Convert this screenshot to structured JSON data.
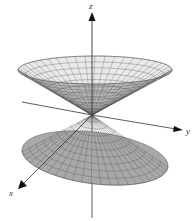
{
  "figure": {
    "type": "double-cone-surface",
    "axes": {
      "x_label": "x",
      "y_label": "y",
      "z_label": "z"
    },
    "colors": {
      "upper_surface": "#e9e9e9",
      "upper_inner": "#bdbdbd",
      "lower_surface": "#a8a8a8",
      "mesh": "#555555",
      "axis": "#333333",
      "background": "#ffffff"
    }
  }
}
